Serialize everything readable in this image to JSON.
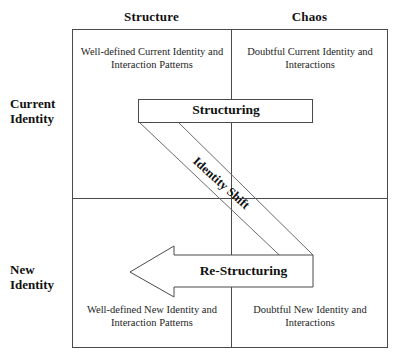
{
  "diagram": {
    "columns": [
      {
        "id": "structure",
        "label": "Structure"
      },
      {
        "id": "chaos",
        "label": "Chaos"
      }
    ],
    "rows": [
      {
        "id": "current-identity",
        "label": "Current\nIdentity",
        "line1": "Current",
        "line2": "Identity"
      },
      {
        "id": "new-identity",
        "label": "New\nIdentity",
        "line1": "New",
        "line2": "Identity"
      }
    ],
    "quadrants": {
      "top_left": "Well-defined Current Identity and Interaction Patterns",
      "top_right": "Doubtful Current Identity and Interactions",
      "bottom_left": "Well-defined New Identity and Interaction Patterns",
      "bottom_right": "Doubtful New Identity and Interactions"
    },
    "shapes": {
      "structuring_label": "Structuring",
      "restructuring_label": "Re-Structuring",
      "identity_shift_label": "Identity Shift"
    },
    "colors": {
      "stroke": "#4a4a4a",
      "band_stroke": "#6b6b6b",
      "text": "#111111",
      "background": "#ffffff"
    }
  }
}
